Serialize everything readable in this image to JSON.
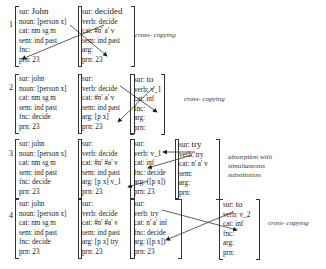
{
  "rows": [
    {
      "num": "1",
      "label": "cross- copying",
      "proplets": [
        {
          "sur": "sur: ",
          "sur_val": "John",
          "lines": [
            "noun: [person x]",
            "cat: nm sg m",
            "sem: ind past",
            "fnc:",
            "prn: 23"
          ]
        },
        {
          "sur": "sur: ",
          "sur_val": "decided",
          "lines": [
            "verb: decide",
            "cat: #n' a' v",
            "sem: ind past",
            "arg:",
            "prn: 23"
          ]
        }
      ]
    },
    {
      "num": "2",
      "label": "cross- copying",
      "proplets": [
        {
          "sur": "sur: john",
          "sur_val": "",
          "lines": [
            "noun: [person x]",
            "cat: nm sg m",
            "sem: ind past",
            "fnc: decide",
            "prn: 23"
          ]
        },
        {
          "sur": "sur:",
          "sur_val": "",
          "lines": [
            "verb: decide",
            "cat: #n' a' v",
            "sem: ind past",
            "arg: [p x]",
            "prn: 23"
          ]
        },
        {
          "sur": "sur: ",
          "sur_val": "to",
          "lines": [
            "verb: v_1",
            "cat: inf",
            "fnc:",
            "arg:",
            "prn:"
          ]
        }
      ]
    },
    {
      "num": "3",
      "label": "absorption with simultaneous substitution",
      "label_lines": [
        "absorption with",
        "simultaneous",
        "substitution"
      ],
      "proplets": [
        {
          "sur": "sur: john",
          "sur_val": "",
          "lines": [
            "noun: [person x]",
            "cat: nm sg m",
            "sem: ind past",
            "fnc: decide",
            "prn: 23"
          ]
        },
        {
          "sur": "sur:",
          "sur_val": "",
          "lines": [
            "verb: decide",
            "cat: #n' #a' v",
            "sem: ind past",
            "arg: [p x] v_1",
            "prn: 23"
          ]
        },
        {
          "sur": "sur:",
          "sur_val": "",
          "lines": [
            "verb: v_1",
            "cat: inf",
            "fnc: decide",
            "arg: ([p x])",
            "prn: 23"
          ]
        },
        {
          "sur": "sur: ",
          "sur_val": "try",
          "lines": [
            "verb: try",
            "cat: n' a' v",
            "sem:",
            "arg:",
            "prn:"
          ]
        }
      ]
    },
    {
      "num": "4",
      "label": "cross- copying",
      "proplets": [
        {
          "sur": "sur: john",
          "sur_val": "",
          "lines": [
            "noun: [person x]",
            "cat: nm sg m",
            "sem: ind past",
            "fnc: decide",
            "prn: 23"
          ]
        },
        {
          "sur": "sur:",
          "sur_val": "",
          "lines": [
            "verb: decide",
            "cat: #n' #a' v",
            "sem: ind past",
            "arg: [p x] try",
            "prn: 23"
          ]
        },
        {
          "sur": "sur:",
          "sur_val": "",
          "lines": [
            "verb: try",
            "cat: n' a' inf",
            "fnc: decide",
            "arg: ([p x])",
            "prn: 23"
          ]
        },
        {
          "sur": "sur: ",
          "sur_val": "to",
          "lines": [
            "verb: v_2",
            "cat: inf",
            "fnc:",
            "arg:",
            "prn:"
          ]
        }
      ]
    }
  ]
}
